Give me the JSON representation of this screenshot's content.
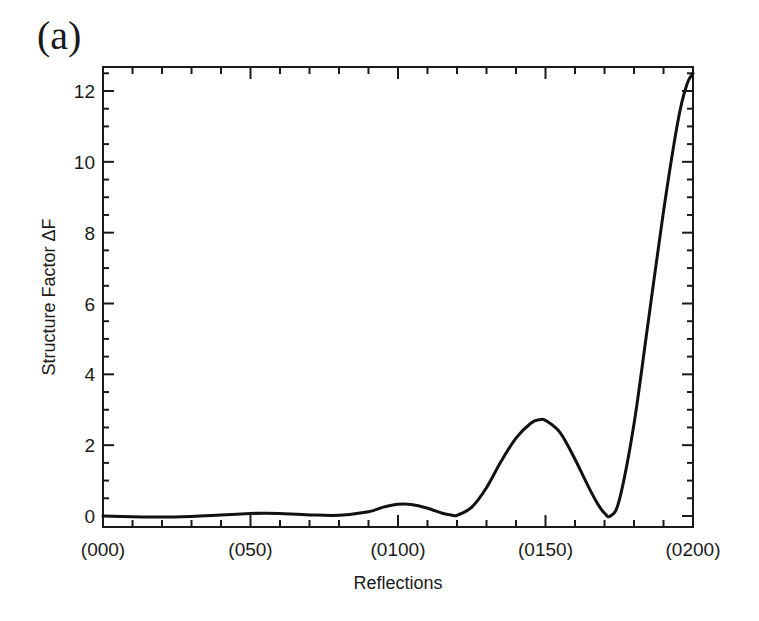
{
  "panel_label": "(a)",
  "chart_data": {
    "type": "line",
    "title": "",
    "xlabel": "Reflections",
    "ylabel": "Structure Factor ΔF",
    "x_tick_labels": [
      "(000)",
      "(050)",
      "(0100)",
      "(0150)",
      "(0200)"
    ],
    "x_tick_positions": [
      0,
      50,
      100,
      150,
      200
    ],
    "xlim": [
      0,
      200
    ],
    "y_ticks": [
      0,
      2,
      4,
      6,
      8,
      10,
      12
    ],
    "ylim": [
      -0.3,
      12.7
    ],
    "grid": false,
    "legend": null,
    "series": [
      {
        "name": "Structure Factor ΔF",
        "color": "#111111",
        "x": [
          0,
          10,
          20,
          30,
          40,
          50,
          55,
          60,
          70,
          80,
          90,
          95,
          100,
          105,
          110,
          115,
          118,
          120,
          125,
          130,
          135,
          140,
          145,
          148,
          150,
          155,
          160,
          165,
          168,
          170,
          172,
          175,
          180,
          185,
          190,
          195,
          198,
          200
        ],
        "values": [
          0.0,
          -0.02,
          -0.03,
          -0.01,
          0.03,
          0.07,
          0.08,
          0.07,
          0.03,
          0.02,
          0.12,
          0.25,
          0.33,
          0.32,
          0.22,
          0.08,
          0.03,
          0.02,
          0.25,
          0.8,
          1.55,
          2.2,
          2.62,
          2.72,
          2.7,
          2.35,
          1.6,
          0.75,
          0.3,
          0.08,
          0.0,
          0.45,
          2.6,
          5.6,
          8.6,
          11.2,
          12.2,
          12.5
        ]
      }
    ]
  }
}
